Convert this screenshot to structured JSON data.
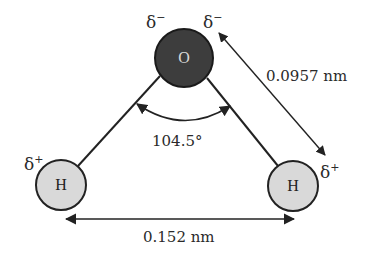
{
  "diagram": {
    "type": "water-molecule-geometry",
    "atoms": [
      {
        "id": "oxygen",
        "symbol": "O",
        "charge": "δ−",
        "fill": "#3d3d3d",
        "text_color": "#d8d8d8",
        "cx": 184,
        "cy": 58,
        "r": 29
      },
      {
        "id": "hydrogen-left",
        "symbol": "H",
        "charge": "δ+",
        "fill": "#d9d9d9",
        "text_color": "#222222",
        "cx": 61,
        "cy": 185,
        "r": 25
      },
      {
        "id": "hydrogen-right",
        "symbol": "H",
        "charge": "δ+",
        "fill": "#d9d9d9",
        "text_color": "#222222",
        "cx": 293,
        "cy": 186,
        "r": 25
      }
    ],
    "charges": {
      "oxygen_left": {
        "symbol": "δ",
        "sign": "−"
      },
      "oxygen_right": {
        "symbol": "δ",
        "sign": "−"
      },
      "hydrogen_left": {
        "symbol": "δ",
        "sign": "+"
      },
      "hydrogen_right": {
        "symbol": "δ",
        "sign": "+"
      }
    },
    "measurements": {
      "bond_length": "0.0957 nm",
      "bond_angle": "104.5°",
      "h_h_distance": "0.152 nm"
    },
    "colors": {
      "line": "#222222",
      "oxygen_fill": "#3d3d3d",
      "hydrogen_fill": "#d9d9d9",
      "text": "#2a2a2a"
    }
  }
}
